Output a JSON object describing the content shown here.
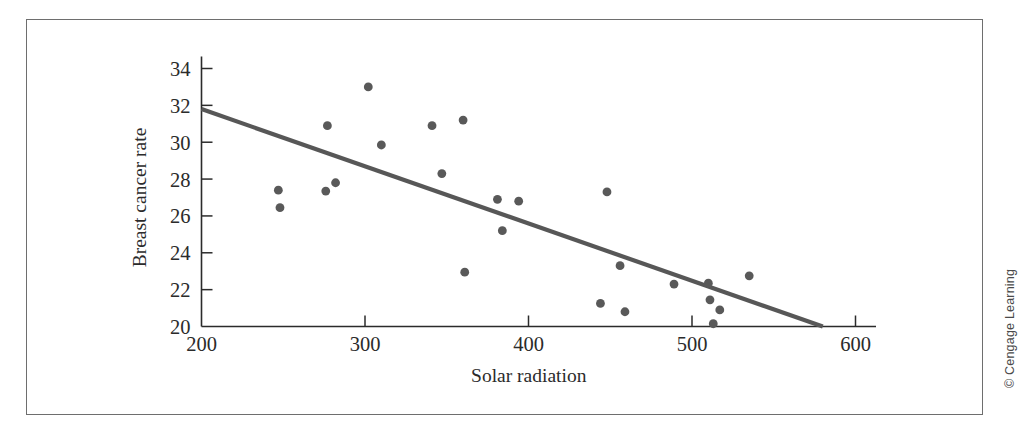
{
  "figure": {
    "credit": "© Cengage Learning",
    "background_color": "#ffffff",
    "frame_color": "#6e6e6e",
    "marker_color": "#595959",
    "line_color": "#575757",
    "axis_color": "#2b2b2b"
  },
  "chart_data": {
    "type": "scatter",
    "title": "",
    "xlabel": "Solar radiation",
    "ylabel": "Breast cancer rate",
    "xlim": [
      200,
      620
    ],
    "ylim": [
      20,
      35
    ],
    "xticks": [
      200,
      300,
      400,
      500,
      600
    ],
    "xtick_labels": [
      "200",
      "300",
      "400",
      "500",
      "600"
    ],
    "yticks": [
      20,
      22,
      24,
      26,
      28,
      30,
      32,
      34
    ],
    "ytick_labels": [
      "20",
      "22",
      "24",
      "26",
      "28",
      "30",
      "32",
      "34"
    ],
    "grid": false,
    "legend": null,
    "points": [
      {
        "x": 247,
        "y": 27.4
      },
      {
        "x": 248,
        "y": 26.45
      },
      {
        "x": 277,
        "y": 30.9
      },
      {
        "x": 276,
        "y": 27.35
      },
      {
        "x": 282,
        "y": 27.8
      },
      {
        "x": 302,
        "y": 33.0
      },
      {
        "x": 310,
        "y": 29.85
      },
      {
        "x": 341,
        "y": 30.9
      },
      {
        "x": 347,
        "y": 28.3
      },
      {
        "x": 360,
        "y": 31.2
      },
      {
        "x": 361,
        "y": 22.95
      },
      {
        "x": 381,
        "y": 26.9
      },
      {
        "x": 384,
        "y": 25.2
      },
      {
        "x": 394,
        "y": 26.8
      },
      {
        "x": 444,
        "y": 21.25
      },
      {
        "x": 448,
        "y": 27.3
      },
      {
        "x": 456,
        "y": 23.3
      },
      {
        "x": 459,
        "y": 20.8
      },
      {
        "x": 489,
        "y": 22.3
      },
      {
        "x": 510,
        "y": 22.35
      },
      {
        "x": 511,
        "y": 21.45
      },
      {
        "x": 513,
        "y": 20.15
      },
      {
        "x": 517,
        "y": 20.9
      },
      {
        "x": 535,
        "y": 22.75
      }
    ],
    "trendline": {
      "label": "regression line",
      "x0": 200,
      "y0": 31.8,
      "x1": 580,
      "y1": 20.0
    },
    "annotations": [
      "© Cengage Learning"
    ]
  }
}
